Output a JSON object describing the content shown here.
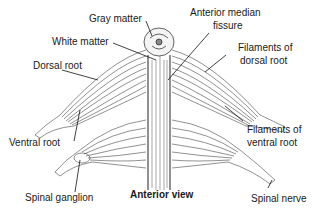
{
  "diagram": {
    "caption": "Anterior view",
    "labels": {
      "gray_matter": "Gray matter",
      "white_matter": "White matter",
      "dorsal_root": "Dorsal root",
      "ventral_root": "Ventral root",
      "spinal_ganglion": "Spinal ganglion",
      "anterior_median_fissure_1": "Anterior median",
      "anterior_median_fissure_2": "fissure",
      "filaments_dorsal_1": "Filaments of",
      "filaments_dorsal_2": "dorsal root",
      "filaments_ventral_1": "Filaments of",
      "filaments_ventral_2": "ventral root",
      "spinal_nerve": "Spinal nerve"
    },
    "colors": {
      "ink": "#1a1a1a",
      "background": "#ffffff"
    }
  }
}
